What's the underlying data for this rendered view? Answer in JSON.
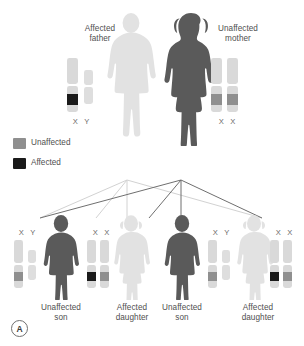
{
  "panel": {
    "tag": "A"
  },
  "figure": {
    "colors": {
      "affected_dark": "#4d4d4d",
      "unaffected_light": "#dcdcdc",
      "band_unaffected": "#9a9a9a",
      "band_affected": "#1a1a1a",
      "chromosome_body": "#d9d9d9",
      "text": "#4f4f4f",
      "line_dark": "#6f6f6f",
      "line_light": "#d5d5d5",
      "background": "#ffffff"
    }
  },
  "legend": {
    "items": [
      {
        "label": "Unaffected",
        "swatch_color": "#9a9a9a",
        "state": "unaffected"
      },
      {
        "label": "Affected",
        "swatch_color": "#1a1a1a",
        "state": "affected"
      }
    ]
  },
  "parents": [
    {
      "id": "father",
      "label": "Affected\nfather",
      "sex": "male",
      "status": "affected",
      "silhouette_color": "#e2e2e2",
      "karyotype_label": "X  Y",
      "chromosomes": [
        {
          "type": "X",
          "band": "affected"
        },
        {
          "type": "Y",
          "band": "none"
        }
      ]
    },
    {
      "id": "mother",
      "label": "Unaffected\nmother",
      "sex": "female",
      "status": "unaffected",
      "silhouette_color": "#5a5a5a",
      "karyotype_label": "X  X",
      "chromosomes": [
        {
          "type": "X",
          "band": "unaffected"
        },
        {
          "type": "X",
          "band": "unaffected"
        }
      ]
    }
  ],
  "children": [
    {
      "id": "child-1",
      "label": "Unaffected\nson",
      "sex": "male",
      "status": "unaffected",
      "silhouette_color": "#5a5a5a",
      "karyotype_label": "X  Y",
      "chromosomes": [
        {
          "type": "X",
          "band": "unaffected"
        },
        {
          "type": "Y",
          "band": "none"
        }
      ],
      "inherits_from": "mother"
    },
    {
      "id": "child-2",
      "label": "Affected\ndaughter",
      "sex": "female",
      "status": "affected",
      "silhouette_color": "#e2e2e2",
      "karyotype_label": "X  X",
      "chromosomes": [
        {
          "type": "X",
          "band": "affected"
        },
        {
          "type": "X",
          "band": "unaffected"
        }
      ],
      "inherits_from": "father"
    },
    {
      "id": "child-3",
      "label": "Unaffected\nson",
      "sex": "male",
      "status": "unaffected",
      "silhouette_color": "#5a5a5a",
      "karyotype_label": "X  Y",
      "chromosomes": [
        {
          "type": "X",
          "band": "unaffected"
        },
        {
          "type": "Y",
          "band": "none"
        }
      ],
      "inherits_from": "mother"
    },
    {
      "id": "child-4",
      "label": "Affected\ndaughter",
      "sex": "female",
      "status": "affected",
      "silhouette_color": "#e2e2e2",
      "karyotype_label": "X  X",
      "chromosomes": [
        {
          "type": "X",
          "band": "affected"
        },
        {
          "type": "X",
          "band": "unaffected"
        }
      ],
      "inherits_from": "father"
    }
  ]
}
